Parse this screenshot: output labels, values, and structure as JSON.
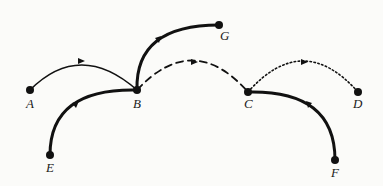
{
  "diagram": {
    "type": "directed-graph",
    "nodes": [
      {
        "id": "A",
        "label": "A",
        "x": 30,
        "y": 90
      },
      {
        "id": "B",
        "label": "B",
        "x": 137,
        "y": 90
      },
      {
        "id": "G",
        "label": "G",
        "x": 219,
        "y": 25
      },
      {
        "id": "C",
        "label": "C",
        "x": 248,
        "y": 92
      },
      {
        "id": "D",
        "label": "D",
        "x": 358,
        "y": 92
      },
      {
        "id": "E",
        "label": "E",
        "x": 50,
        "y": 155
      },
      {
        "id": "F",
        "label": "F",
        "x": 335,
        "y": 160
      }
    ],
    "edges": [
      {
        "from": "A",
        "to": "B",
        "style": "solid-thin"
      },
      {
        "from": "E",
        "to": "B",
        "style": "solid-thick"
      },
      {
        "from": "B",
        "to": "G",
        "style": "solid-thick"
      },
      {
        "from": "B",
        "to": "C",
        "style": "dashed"
      },
      {
        "from": "C",
        "to": "D",
        "style": "dotted"
      },
      {
        "from": "F",
        "to": "C",
        "style": "solid-thick"
      }
    ],
    "labels": {
      "A": "A",
      "B": "B",
      "C": "C",
      "D": "D",
      "E": "E",
      "F": "F",
      "G": "G"
    }
  }
}
